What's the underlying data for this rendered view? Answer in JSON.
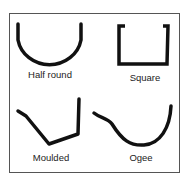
{
  "profiles": [
    {
      "id": "half-round",
      "label": "Half round"
    },
    {
      "id": "square",
      "label": "Square"
    },
    {
      "id": "moulded",
      "label": "Moulded"
    },
    {
      "id": "ogee",
      "label": "Ogee"
    }
  ],
  "colors": {
    "stroke": "#111111",
    "frame": "#555555",
    "background": "#ffffff"
  }
}
